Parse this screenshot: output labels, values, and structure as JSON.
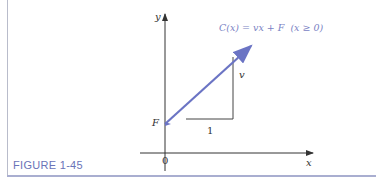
{
  "figure": {
    "caption": "FIGURE 1-45",
    "equation": "C(x) = vx + F  (x ≥ 0)",
    "labels": {
      "y_axis": "y",
      "x_axis": "x",
      "origin": "0",
      "intercept": "F",
      "rise": "v",
      "run": "1"
    },
    "colors": {
      "line": "#6b74c4",
      "caption": "#6a73b8",
      "frame": "#a9aed0",
      "axis": "#333333"
    }
  }
}
